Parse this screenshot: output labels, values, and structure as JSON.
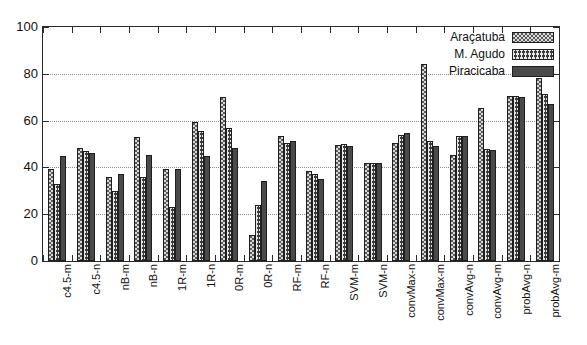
{
  "chart_data": {
    "type": "bar",
    "title": "",
    "xlabel": "",
    "ylabel": "",
    "ylim": [
      0,
      100
    ],
    "ytick_labels": [
      "0",
      "20",
      "40",
      "60",
      "80",
      "100"
    ],
    "yticks": [
      0,
      20,
      40,
      60,
      80,
      100
    ],
    "grid": true,
    "legend_position": "top-right",
    "categories": [
      "c4.5-m",
      "c4.5-n",
      "nB-m",
      "nB-n",
      "1R-m",
      "1R-n",
      "0R-m",
      "0R-n",
      "RF-m",
      "RF-n",
      "SVM-m",
      "SVM-n",
      "convMax-n",
      "convMax-m",
      "convAvg-n",
      "convAvg-m",
      "probAvg-n",
      "probAvg-m"
    ],
    "series": [
      {
        "name": "Araçatuba",
        "pattern": "dotted-light",
        "color": "#d9d9d9",
        "values": [
          39.5,
          48.5,
          36.0,
          53.0,
          39.5,
          59.5,
          70.0,
          11.0,
          53.5,
          38.5,
          49.5,
          42.0,
          50.5,
          84.0,
          45.5,
          65.5,
          70.5,
          78.0
        ]
      },
      {
        "name": "M. Agudo",
        "pattern": "crosshatch",
        "color": "#3a3a3a",
        "values": [
          33.0,
          47.0,
          30.0,
          36.0,
          23.0,
          55.5,
          57.0,
          24.0,
          50.5,
          37.0,
          50.0,
          42.0,
          54.0,
          51.5,
          53.5,
          48.0,
          70.5,
          71.5
        ]
      },
      {
        "name": "Piracicaba",
        "pattern": "solid",
        "color": "#4a4a4a",
        "values": [
          45.0,
          46.0,
          37.0,
          45.5,
          39.5,
          45.0,
          48.5,
          34.0,
          51.5,
          35.0,
          49.0,
          42.0,
          54.5,
          49.0,
          53.5,
          47.5,
          70.0,
          67.0
        ]
      }
    ]
  },
  "legend": {
    "entries": [
      {
        "label": "Araçatuba"
      },
      {
        "label": "M. Agudo"
      },
      {
        "label": "Piracicaba"
      }
    ]
  }
}
